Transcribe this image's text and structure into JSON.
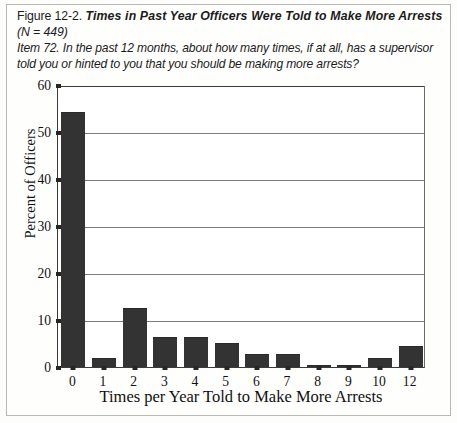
{
  "caption": {
    "figure_label": "Figure 12-2.",
    "title": "Times in Past Year Officers Were Told to Make More Arrests",
    "n_line": "(N = 449)",
    "item_line_1": "Item 72. In the past 12 months, about how many times, if at all, has a supervisor",
    "item_line_2": "told you or hinted to you that you should be making more arrests?"
  },
  "colors": {
    "bar": "#333333",
    "grid": "#7c7c7c",
    "axis": "#3a3a3a",
    "text": "#101010",
    "page_border": "#b8b8b4"
  },
  "chart_data": {
    "type": "bar",
    "title": "Times in Past Year Officers Were Told to Make More Arrests",
    "xlabel": "Times per Year Told to Make More Arrests",
    "ylabel": "Percent of Officers",
    "categories": [
      "0",
      "1",
      "2",
      "3",
      "4",
      "5",
      "6",
      "7",
      "8",
      "9",
      "10",
      "12"
    ],
    "values": [
      54.0,
      1.6,
      12.3,
      6.2,
      6.2,
      5.0,
      2.5,
      2.5,
      0.3,
      0.3,
      1.6,
      4.3
    ],
    "ylim": [
      0,
      60
    ],
    "yticks": [
      0,
      10,
      20,
      30,
      40,
      50,
      60
    ],
    "ytick_labels": [
      "0",
      "10",
      "20",
      "30",
      "40",
      "50",
      "60"
    ],
    "grid": true,
    "grid_axis": "y",
    "legend": false,
    "n": 449
  }
}
